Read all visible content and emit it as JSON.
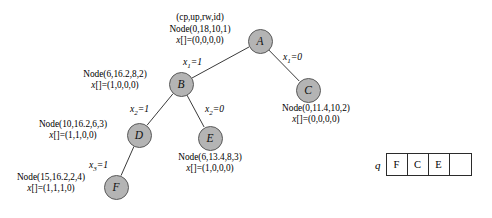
{
  "diagram": {
    "header_legend": "(cp,up,rw,id)",
    "nodes": [
      {
        "id": "A",
        "letter": "A",
        "node_text": "Node(0,18,10,1)",
        "x_text": "x[]=(0,0,0,0)",
        "cx": 260,
        "cy": 41,
        "label_x": 158,
        "label_y": 24,
        "label_align": "center",
        "label_w": 84
      },
      {
        "id": "B",
        "letter": "B",
        "node_text": "Node(6,16.2,8,2)",
        "x_text": "x[]=(1,0,0,0)",
        "cx": 181,
        "cy": 84,
        "label_x": 68,
        "label_y": 69,
        "label_align": "center",
        "label_w": 94
      },
      {
        "id": "C",
        "letter": "C",
        "node_text": "Node(0,11.4,10,2)",
        "x_text": "x[]=(0,0,0,0)",
        "cx": 308,
        "cy": 90,
        "label_x": 268,
        "label_y": 103,
        "label_align": "center",
        "label_w": 96
      },
      {
        "id": "D",
        "letter": "D",
        "node_text": "Node(10,16.2,6,3)",
        "x_text": "x[]=(1,1,0,0)",
        "cx": 139,
        "cy": 135,
        "label_x": 24,
        "label_y": 119,
        "label_align": "center",
        "label_w": 98
      },
      {
        "id": "E",
        "letter": "E",
        "node_text": "Node(6,13.4,8,3)",
        "x_text": "x[]=(1,0,0,0)",
        "cx": 210,
        "cy": 138,
        "label_x": 163,
        "label_y": 152,
        "label_align": "center",
        "label_w": 94
      },
      {
        "id": "F",
        "letter": "F",
        "node_text": "Node(15,16.2,2,4)",
        "x_text": "x[]=(1,1,1,0)",
        "cx": 116,
        "cy": 187,
        "label_x": 2,
        "label_y": 172,
        "label_align": "center",
        "label_w": 98
      }
    ],
    "edges": [
      {
        "from": "A",
        "to": "B",
        "var": "x",
        "sub": "1",
        "value": "1",
        "lx": 183,
        "ly": 57
      },
      {
        "from": "A",
        "to": "C",
        "var": "x",
        "sub": "1",
        "value": "0",
        "lx": 283,
        "ly": 52
      },
      {
        "from": "B",
        "to": "D",
        "var": "x",
        "sub": "2",
        "value": "1",
        "lx": 130,
        "ly": 104
      },
      {
        "from": "B",
        "to": "E",
        "var": "x",
        "sub": "2",
        "value": "0",
        "lx": 205,
        "ly": 104
      },
      {
        "from": "D",
        "to": "F",
        "var": "x",
        "sub": "3",
        "value": "1",
        "lx": 89,
        "ly": 160
      }
    ]
  },
  "queue": {
    "name": "q",
    "cells": [
      "F",
      "C",
      "E",
      ""
    ]
  },
  "colors": {
    "node_fill": "#b4b4b4",
    "node_stroke": "#5a5a5a",
    "edge_stroke": "#3a3a3a",
    "text": "#000000",
    "box_stroke": "#2b2b2b",
    "background": "#ffffff"
  }
}
